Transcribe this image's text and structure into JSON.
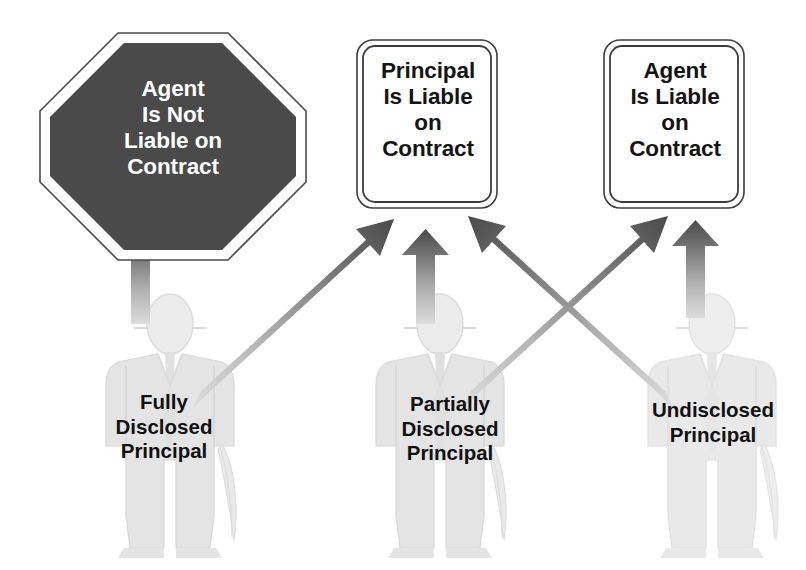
{
  "diagram": {
    "background_color": "#ffffff",
    "colors": {
      "stop_sign_fill": "#4a4a4a",
      "stop_sign_text": "#ffffff",
      "sign_fill": "#ffffff",
      "sign_border": "#3d3d3d",
      "sign_text": "#141414",
      "figure_fill": "#e2e2e2",
      "figure_fill_light": "#ededed",
      "figure_outline": "#d2d2d2",
      "label_text": "#111111",
      "arrow_head": "#4f4f4f",
      "arrow_tail": "#d8d8d8"
    }
  },
  "outcomes": [
    {
      "id": "agent-not-liable",
      "shape": "octagon",
      "text": "Agent\nIs Not\nLiable on\nContract"
    },
    {
      "id": "principal-liable",
      "shape": "rounded-rect",
      "text": "Principal\nIs Liable\non\nContract"
    },
    {
      "id": "agent-liable",
      "shape": "rounded-rect",
      "text": "Agent\nIs Liable\non\nContract"
    }
  ],
  "figures": [
    {
      "id": "fully-disclosed-principal",
      "label": "Fully\nDisclosed\nPrincipal",
      "icon": "businessman-silhouette-icon"
    },
    {
      "id": "partially-disclosed-principal",
      "label": "Partially\nDisclosed\nPrincipal",
      "icon": "businessman-silhouette-icon"
    },
    {
      "id": "undisclosed-principal",
      "label": "Undisclosed\nPrincipal",
      "icon": "businessman-silhouette-icon"
    }
  ],
  "arrows": [
    {
      "id": "fully-to-agent-not-liable",
      "from": "fully-disclosed-principal",
      "to": "agent-not-liable",
      "direction": "up"
    },
    {
      "id": "fully-to-principal-liable",
      "from": "fully-disclosed-principal",
      "to": "principal-liable",
      "direction": "up-right"
    },
    {
      "id": "partially-to-principal-liable",
      "from": "partially-disclosed-principal",
      "to": "principal-liable",
      "direction": "up"
    },
    {
      "id": "partially-to-agent-liable",
      "from": "partially-disclosed-principal",
      "to": "agent-liable",
      "direction": "up-right"
    },
    {
      "id": "undisclosed-to-principal-liable",
      "from": "undisclosed-principal",
      "to": "principal-liable",
      "direction": "up-left"
    },
    {
      "id": "undisclosed-to-agent-liable",
      "from": "undisclosed-principal",
      "to": "agent-liable",
      "direction": "up"
    }
  ]
}
